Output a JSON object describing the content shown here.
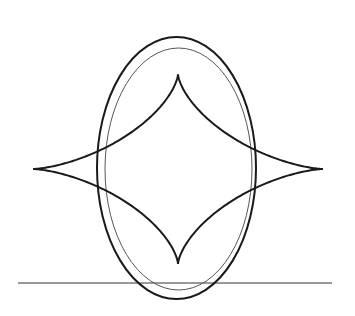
{
  "figure": {
    "colors": {
      "background": "#ffffff",
      "stroke_dark": "#1a1a1a",
      "stroke_light": "#555555"
    },
    "baseline": {
      "x1": 18,
      "y1": 283,
      "x2": 332,
      "y2": 283
    },
    "outer_ellipse": {
      "cx": 176.5,
      "cy": 168,
      "rx": 79.5,
      "ry": 131
    },
    "inner_ellipse": {
      "cx": 178.5,
      "cy": 169,
      "rx": 73.5,
      "ry": 121
    },
    "astroid": {
      "cx": 178,
      "cy": 169,
      "a": 145,
      "b": 95
    }
  }
}
